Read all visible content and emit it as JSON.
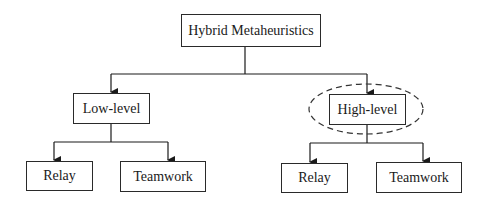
{
  "diagram": {
    "root": {
      "label": "Hybrid Metaheuristics"
    },
    "branches": [
      {
        "label": "Low-level",
        "highlighted": false,
        "children": [
          {
            "label": "Relay"
          },
          {
            "label": "Teamwork"
          }
        ]
      },
      {
        "label": "High-level",
        "highlighted": true,
        "children": [
          {
            "label": "Relay"
          },
          {
            "label": "Teamwork"
          }
        ]
      }
    ],
    "colors": {
      "line": "#1a1a1a",
      "highlight_ellipse": "#333333",
      "background": "#ffffff"
    }
  }
}
